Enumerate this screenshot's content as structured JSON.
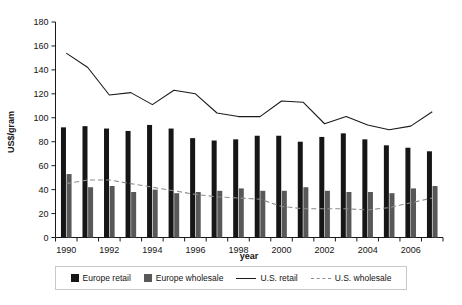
{
  "chart_data": {
    "type": "bar",
    "title": "",
    "subtitle": "",
    "xlabel": "year",
    "ylabel": "US$/gram",
    "ylim": [
      0,
      180
    ],
    "xlim": [
      1990,
      2007
    ],
    "yticks": [
      0,
      20,
      40,
      60,
      80,
      100,
      120,
      140,
      160,
      180
    ],
    "ytick_labels": [
      "0",
      "20",
      "40",
      "60",
      "80",
      "100",
      "120",
      "140",
      "160",
      "180"
    ],
    "categories": [
      1990,
      1991,
      1992,
      1993,
      1994,
      1995,
      1996,
      1997,
      1998,
      1999,
      2000,
      2001,
      2002,
      2003,
      2004,
      2005,
      2006,
      2007
    ],
    "xtick_labels": [
      "1990",
      "",
      "1992",
      "",
      "1994",
      "",
      "1996",
      "",
      "1998",
      "",
      "2000",
      "",
      "2002",
      "",
      "2004",
      "",
      "2006",
      ""
    ],
    "grid": false,
    "legend_position": "bottom",
    "series": [
      {
        "name": "Europe retail",
        "render": "bar",
        "color": "#161616",
        "values": [
          92,
          93,
          91,
          89,
          94,
          91,
          83,
          81,
          82,
          85,
          85,
          80,
          84,
          87,
          82,
          77,
          75,
          72
        ]
      },
      {
        "name": "Europe wholesale",
        "render": "bar",
        "color": "#585858",
        "values": [
          53,
          42,
          43,
          38,
          40,
          37,
          38,
          39,
          41,
          39,
          39,
          42,
          39,
          38,
          38,
          37,
          41,
          43
        ]
      },
      {
        "name": "U.S. retail",
        "render": "line",
        "color": "#1a1a1a",
        "style": "solid",
        "values": [
          154,
          142,
          119,
          121,
          111,
          123,
          120,
          104,
          101,
          101,
          114,
          113,
          95,
          101,
          94,
          90,
          93,
          105
        ]
      },
      {
        "name": "U.S. wholesale",
        "render": "line",
        "color": "#8d8d8d",
        "style": "dashed",
        "values": [
          45,
          48,
          48,
          45,
          42,
          39,
          36,
          34,
          33,
          32,
          26,
          24,
          24,
          24,
          23,
          25,
          29,
          33
        ]
      }
    ]
  },
  "legend": {
    "items": [
      {
        "label": "Europe retail",
        "marker": "square-black-icon"
      },
      {
        "label": "Europe wholesale",
        "marker": "square-gray-icon"
      },
      {
        "label": "U.S. retail",
        "marker": "solid-line-icon"
      },
      {
        "label": "U.S. wholesale",
        "marker": "dashed-line-icon"
      }
    ]
  }
}
